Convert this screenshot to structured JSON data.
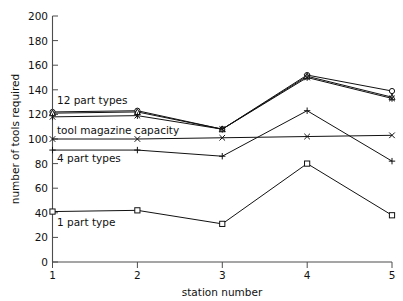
{
  "chart_data": {
    "type": "line",
    "title": "",
    "subtitle": "",
    "xlabel": "station number",
    "ylabel": "number of tools required",
    "x": [
      1,
      2,
      3,
      4,
      5
    ],
    "xticklabels": [
      "1",
      "2",
      "3",
      "4",
      "5"
    ],
    "yticklabels": [
      "0",
      "20",
      "40",
      "60",
      "80",
      "100",
      "120",
      "140",
      "160",
      "180",
      "200"
    ],
    "yticks": [
      0,
      20,
      40,
      60,
      80,
      100,
      120,
      140,
      160,
      180,
      200
    ],
    "xlim": [
      1,
      5
    ],
    "ylim": [
      0,
      200
    ],
    "grid": false,
    "legend_position": "inline-annotations",
    "series": [
      {
        "name": "12 part types (circle)",
        "marker": "circle-open",
        "values": [
          122,
          123,
          108,
          152,
          139
        ]
      },
      {
        "name": "12 part types (triangle)",
        "marker": "triangle-open",
        "values": [
          121,
          122,
          108,
          151,
          134
        ]
      },
      {
        "name": "8 part types",
        "marker": "asterisk",
        "values": [
          118,
          119,
          108,
          150,
          133
        ]
      },
      {
        "name": "tool magazine capacity",
        "marker": "cross-x",
        "values": [
          100,
          100,
          101,
          102,
          103
        ]
      },
      {
        "name": "4 part types",
        "marker": "plus",
        "values": [
          91,
          91,
          86,
          123,
          82
        ]
      },
      {
        "name": "1 part type",
        "marker": "square-open",
        "values": [
          41,
          42,
          31,
          80,
          38
        ]
      }
    ],
    "annotations": [
      {
        "text": "12 part types",
        "x_px": 57,
        "y_px": 104
      },
      {
        "text": "tool magazine capacity",
        "x_px": 57,
        "y_px": 134
      },
      {
        "text": "4 part types",
        "x_px": 57,
        "y_px": 162
      },
      {
        "text": "1 part type",
        "x_px": 57,
        "y_px": 226
      }
    ]
  },
  "axes": {
    "y_axis_title": "number of tools required",
    "x_axis_title": "station number"
  },
  "ticks": {
    "y": {
      "t0": "0",
      "t1": "20",
      "t2": "40",
      "t3": "60",
      "t4": "80",
      "t5": "100",
      "t6": "120",
      "t7": "140",
      "t8": "160",
      "t9": "180",
      "t10": "200"
    },
    "x": {
      "t0": "1",
      "t1": "2",
      "t2": "3",
      "t3": "4",
      "t4": "5"
    }
  },
  "annotations": {
    "a0": "12 part types",
    "a1": "tool magazine capacity",
    "a2": "4 part types",
    "a3": "1 part type"
  },
  "colors": {
    "ink": "#111111",
    "axis": "#4d4d4d",
    "background": "#ffffff"
  }
}
